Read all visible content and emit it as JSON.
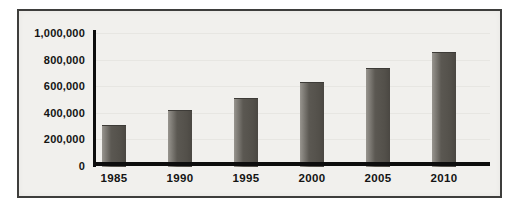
{
  "chart": {
    "frame_border_color": "#3e3e3c",
    "plot_background": "#f1f0ed",
    "axis_color": "#0d0d0d",
    "bar_color": "#53504a",
    "bar_highlight_color": "#98958f",
    "label_color": "#141414"
  },
  "chart_data": {
    "type": "bar",
    "categories": [
      "1985",
      "1990",
      "1995",
      "2000",
      "2005",
      "2010"
    ],
    "values": [
      310000,
      420000,
      510000,
      630000,
      740000,
      860000
    ],
    "title": "",
    "xlabel": "",
    "ylabel": "",
    "ylim": [
      0,
      1000000
    ],
    "ytick_interval": 200000,
    "ytick_labels": [
      "0",
      "200,000",
      "400,000",
      "600,000",
      "800,000",
      "1,000,000"
    ],
    "grid": "off",
    "legend": "none",
    "bar_orientation": "vertical"
  }
}
